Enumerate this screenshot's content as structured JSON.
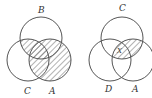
{
  "diagrams": [
    {
      "name": "venn-left",
      "labels": {
        "top": "B",
        "left": "C",
        "right": "A"
      },
      "shaded": "(B ∩ C) ∪ A"
    },
    {
      "name": "venn-right",
      "labels": {
        "top": "C",
        "left": "D",
        "right": "A",
        "region_mark": "X"
      },
      "shaded": "C ∩ A"
    }
  ],
  "colors": {
    "stroke": "#555555",
    "hatch": "#666666"
  }
}
